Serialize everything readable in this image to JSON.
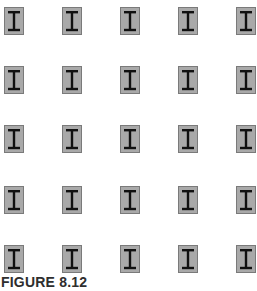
{
  "figure": {
    "caption": "FIGURE 8.12"
  },
  "grid": {
    "rows": 5,
    "cols": 5,
    "col_x": [
      4,
      62,
      120,
      178,
      236
    ],
    "row_y": [
      7,
      66,
      125,
      186,
      245
    ],
    "element": {
      "icon": "i-beam-column-icon",
      "width": 20,
      "height": 28
    }
  },
  "colors": {
    "column_fill": "#a9a9a9",
    "column_border": "#7a7a7a",
    "beam_stroke": "#111111",
    "caption": "#2e2e2e",
    "background": "#ffffff"
  }
}
